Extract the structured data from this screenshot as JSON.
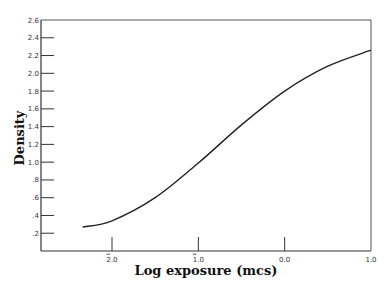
{
  "chart_data": {
    "type": "line",
    "title": "",
    "xlabel": "Log exposure (mcs)",
    "ylabel": "Density",
    "xlim": [
      -2.34,
      1.0
    ],
    "ylim": [
      0,
      2.6
    ],
    "grid": false,
    "legend": null,
    "x_ticks": [
      {
        "value": -2.0,
        "label": "2.0",
        "bar_notation": true,
        "display": "̅ 2.0"
      },
      {
        "value": -1.0,
        "label": "1.0",
        "bar_notation": true,
        "display": "̅ 1.0"
      },
      {
        "value": 0.0,
        "label": "0.0",
        "bar_notation": false
      },
      {
        "value": 1.0,
        "label": "1.0",
        "bar_notation": false
      }
    ],
    "y_ticks": [
      {
        "value": 0.2,
        "label": ".2"
      },
      {
        "value": 0.4,
        "label": ".4"
      },
      {
        "value": 0.6,
        "label": ".6"
      },
      {
        "value": 0.8,
        "label": ".8"
      },
      {
        "value": 1.0,
        "label": "1.0"
      },
      {
        "value": 1.2,
        "label": "1.2"
      },
      {
        "value": 1.4,
        "label": "1.4"
      },
      {
        "value": 1.6,
        "label": "1.6"
      },
      {
        "value": 1.8,
        "label": "1.8"
      },
      {
        "value": 2.0,
        "label": "2.0"
      },
      {
        "value": 2.2,
        "label": "2.2"
      },
      {
        "value": 2.4,
        "label": "2.4"
      },
      {
        "value": 2.6,
        "label": "2.6"
      }
    ],
    "series": [
      {
        "name": "Characteristic curve",
        "x": [
          -2.34,
          -2.0,
          -1.5,
          -1.0,
          -0.5,
          0.0,
          0.5,
          1.0
        ],
        "y": [
          0.27,
          0.34,
          0.6,
          0.99,
          1.42,
          1.8,
          2.08,
          2.26
        ]
      }
    ]
  },
  "labels": {
    "xlabel": "Log exposure (mcs)",
    "ylabel": "Density"
  }
}
